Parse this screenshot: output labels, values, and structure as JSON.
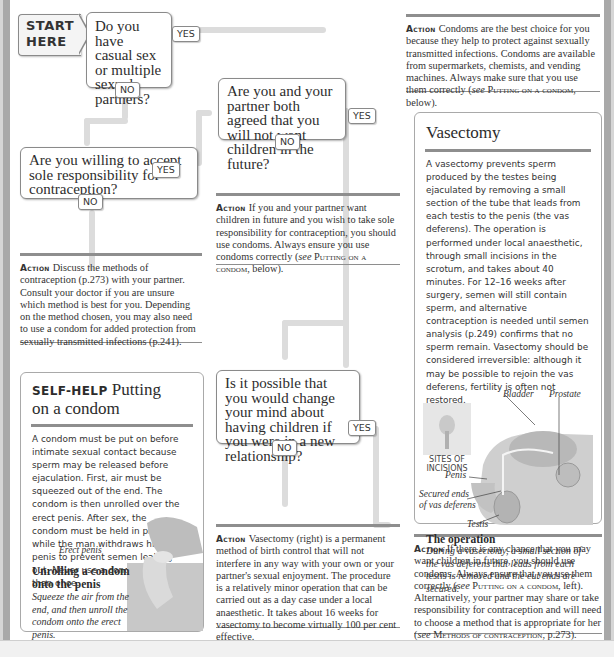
{
  "flowchart": {
    "start": "START\nHERE",
    "q1": {
      "text": "Do you have casual sex or multiple sexual partners?",
      "yes": "YES",
      "no": "NO"
    },
    "q2": {
      "text": "Are you willing to accept sole responsibility for contraception?",
      "yes": "YES",
      "no": "NO"
    },
    "q3": {
      "text": "Are you and your partner both agreed that you will not want children in the future?",
      "yes": "YES",
      "no": "NO"
    },
    "q4": {
      "text": "Is it possible that you would change your mind about having children if you were in a new relationship?",
      "yes": "YES",
      "no": "NO"
    }
  },
  "actions": {
    "label": "Action",
    "a1": {
      "text": "Condoms are the best choice for you because they help to protect against sexually transmitted infections. Condoms are available from supermarkets, chemists, and vending machines. Always make sure that you use them correctly (",
      "see": "see",
      "ref": "Putting on a condom",
      "tail": ", below)."
    },
    "a2": {
      "text": "Discuss the methods of contraception (p.273) with your partner. Consult your doctor if you are unsure which method is best for you. Depending on the method chosen, you may also need to use a condom for added protection from sexually transmitted infections (p.241)."
    },
    "a3": {
      "text": "If you and your partner want children in future and you wish to take sole responsibility for contraception, you should use condoms. Always ensure you use condoms correctly (",
      "see": "see",
      "ref": "Putting on a condom",
      "tail": ", below)."
    },
    "a4": {
      "text": "Vasectomy (right) is a permanent method of birth control that will not interfere in any way with your own or your partner's sexual enjoyment. The procedure is a relatively minor operation that can be carried out as a day case under a local anaesthetic. It takes about 16 weeks for vasectomy to become virtually 100 per cent effective."
    },
    "a5": {
      "text": "If there is any chance that you may want children in future, you should use condoms. Always ensure that you use them correctly (",
      "see": "see",
      "ref": "Putting on a condom",
      "mid": ", left). Alternatively, your partner may share or take responsibility for contraception and will need to choose a method that is appropriate for her (",
      "see2": "see",
      "ref2": "Methods of contraception",
      "tail": ", p.273)."
    }
  },
  "vasectomy_panel": {
    "title": "Vasectomy",
    "body": "A vasectomy prevents sperm produced by the testes being ejaculated by removing a small section of the tube that leads from each testis to the penis (the vas deferens). The operation is performed under local anaesthetic, through small incisions in the scrotum, and takes about 40 minutes. For 12–16 weeks after surgery, semen will still contain sperm, and alternative contraception is needed until semen analysis (p.249) confirms that no sperm remain. Vasectomy should be considered irreversible: although it may be possible to rejoin the vas deferens, fertility is often not restored.",
    "labels": {
      "bladder": "Bladder",
      "prostate": "Prostate",
      "sites": "SITES OF INCISIONS",
      "penis": "Penis",
      "secured": "Secured ends of vas deferens",
      "testis": "Testis"
    },
    "caption_title": "The operation",
    "caption_text": "During a vasectomy, a small section of the vas deferens that leads from each testis is removed and the cut ends are secured."
  },
  "selfhelp_panel": {
    "label": "SELF-HELP",
    "title": "Putting on a condom",
    "body": "A condom must be put on before intimate sexual contact because sperm may be released before ejaculation. First, air must be squeezed out of the end. The condom is then unrolled over the erect penis. After sex, the condom must be held in place while the man withdraws his penis to prevent semen leaking out. Never use a condom more than once.",
    "illustration_label": "Erect penis",
    "caption_title": "Unrolling a condom onto the penis",
    "caption_text": "Squeeze the air from the end, and then unroll the condom onto the erect penis."
  }
}
